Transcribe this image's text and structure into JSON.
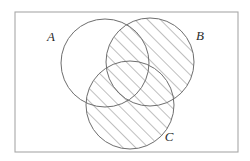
{
  "figure": {
    "type": "venn-diagram",
    "title": "",
    "set_count": 3,
    "shaded_expression": "B union C",
    "background_color": "#ffffff",
    "frame": {
      "name": "universal-set-frame",
      "x": 15,
      "y": 12,
      "width": 223,
      "height": 140,
      "stroke_color": "#a8a8a8",
      "stroke_width": 1.1,
      "fill_color": "#ffffff"
    },
    "circle_style": {
      "stroke_color": "#6e6e6e",
      "stroke_width": 1.0,
      "fill_color": "none"
    },
    "hatch": {
      "angle_degrees": 45,
      "direction": "lower-left-to-upper-right",
      "spacing": 9,
      "stroke_color": "#707070",
      "stroke_width": 0.9
    },
    "circles": [
      {
        "id": "A",
        "label": "A",
        "cx": 105,
        "cy": 63,
        "r": 44,
        "shaded": false,
        "label_x": 51,
        "label_y": 41
      },
      {
        "id": "B",
        "label": "B",
        "cx": 150,
        "cy": 62,
        "r": 44,
        "shaded": true,
        "label_x": 200,
        "label_y": 40
      },
      {
        "id": "C",
        "label": "C",
        "cx": 130,
        "cy": 105,
        "r": 44,
        "shaded": true,
        "label_x": 169,
        "label_y": 141
      }
    ]
  }
}
